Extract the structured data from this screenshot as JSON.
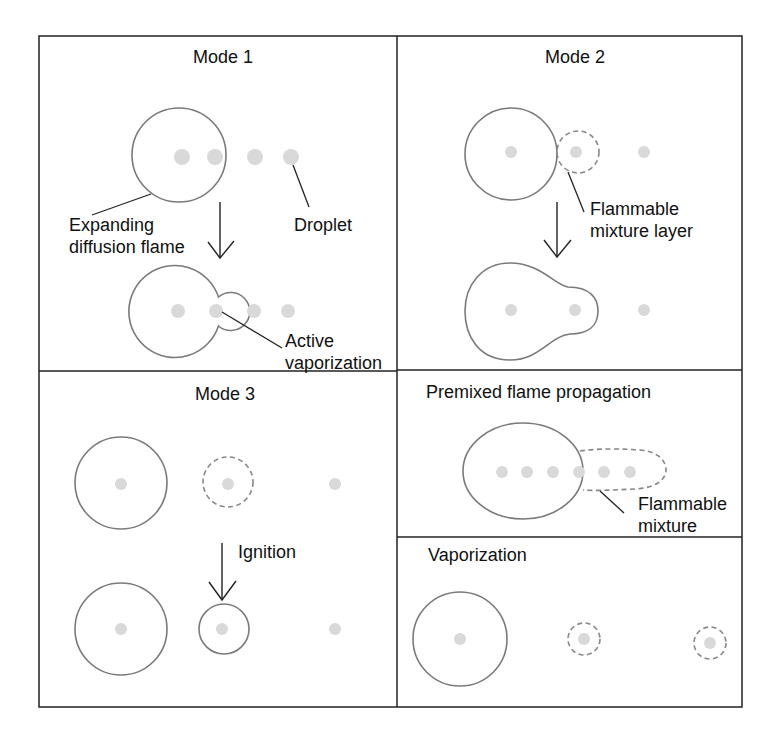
{
  "figure": {
    "colors": {
      "frame": "#222222",
      "flame_outline": "#7a7a7a",
      "flammable_dashed": "#888888",
      "droplet": "#d9d9d9",
      "text": "#111111"
    },
    "panels": {
      "mode1": {
        "title": "Mode 1",
        "labels": {
          "flame_line1": "Expanding",
          "flame_line2": "diffusion flame",
          "droplet": "Droplet",
          "active_line1": "Active",
          "active_line2": "vaporization"
        }
      },
      "mode2": {
        "title": "Mode 2",
        "labels": {
          "layer_line1": "Flammable",
          "layer_line2": "mixture layer"
        }
      },
      "mode3": {
        "title": "Mode 3",
        "labels": {
          "ignition": "Ignition"
        }
      },
      "premixed": {
        "title": "Premixed flame propagation",
        "labels": {
          "mixture_line1": "Flammable",
          "mixture_line2": "mixture"
        }
      },
      "vaporization": {
        "title": "Vaporization"
      }
    }
  }
}
